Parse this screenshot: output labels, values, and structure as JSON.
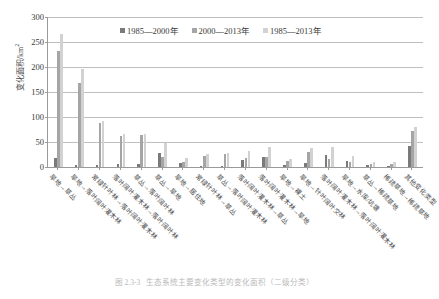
{
  "chart_data": {
    "type": "bar",
    "title": "",
    "xlabel": "",
    "ylabel": "变化面积/km",
    "ylabel_sup": "2",
    "ylim": [
      0,
      300
    ],
    "yticks": [
      0,
      50,
      100,
      150,
      200,
      250,
      300
    ],
    "grid": true,
    "legend_position": "top-center",
    "categories": [
      "旱地→草丛",
      "旱地→落叶阔叶灌木林",
      "常绿针叶林→落叶阔叶灌木林",
      "落叶阔叶灌木林→落叶阔叶林",
      "草丛→落叶阔叶林",
      "草丛→旱地",
      "旱地→居住地",
      "常绿针叶林→草丛",
      "草丛→落叶阔叶灌木林",
      "落叶阔叶灌木林→草丛",
      "落叶阔叶灌木林→旱地",
      "旱地→裸土",
      "旱地→针叶阔叶交林",
      "落叶阔叶灌木林→落叶阔叶灌木林",
      "旱地→水库/坑塘",
      "草丛→稀疏草地",
      "稀疏草地→稀疏草地",
      "其他变化类型"
    ],
    "series": [
      {
        "name": "1985—2000年",
        "color": "#7a7a7a",
        "values": [
          18,
          5,
          4,
          7,
          6,
          28,
          9,
          3,
          2,
          14,
          20,
          4,
          9,
          24,
          13,
          4,
          3,
          42
        ]
      },
      {
        "name": "2000—2013年",
        "color": "#a5a5a5",
        "values": [
          232,
          168,
          88,
          63,
          65,
          20,
          10,
          23,
          27,
          18,
          20,
          13,
          30,
          16,
          10,
          6,
          7,
          72
        ]
      },
      {
        "name": "1985—2013年",
        "color": "#d2d2d2",
        "values": [
          267,
          197,
          93,
          67,
          67,
          48,
          19,
          26,
          29,
          32,
          40,
          17,
          39,
          40,
          23,
          10,
          10,
          80
        ]
      }
    ]
  },
  "caption": {
    "number": "图 2.3-3",
    "text": "生态系统主要变化类型的变化面积（二级分类）"
  }
}
